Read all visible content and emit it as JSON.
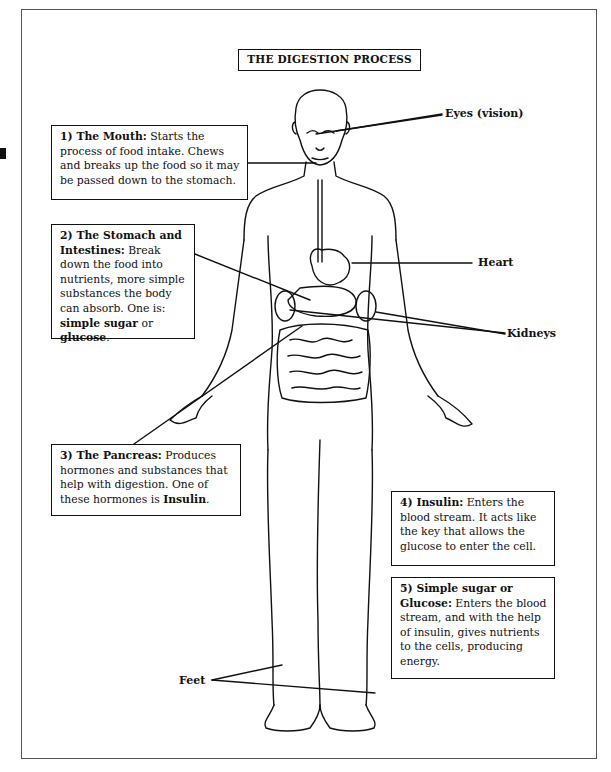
{
  "title": "THE DIGESTION PROCESS",
  "boxes": [
    {
      "id": "mouth",
      "heading": "1) The Mouth:",
      "text": " Starts the process of food intake. Chews and breaks up the food so it may be passed down to the stomach."
    },
    {
      "id": "stomach",
      "heading": "2) The Stomach and Intestines:",
      "text": " Break down the food into nutrients, more simple substances the body can absorb. One is: ",
      "bold_tail": "simple sugar",
      "mid": " or ",
      "bold_end": "glucose",
      "end": "."
    },
    {
      "id": "pancreas",
      "heading": "3) The Pancreas:",
      "text": " Produces hormones and substances that help with digestion. One of these hormones is ",
      "bold_tail": "Insulin",
      "end": "."
    },
    {
      "id": "insulin",
      "heading": "4) Insulin:",
      "text": " Enters the blood stream. It acts like the key that allows the glucose to enter the cell."
    },
    {
      "id": "glucose",
      "heading": "5) Simple sugar or Glucose:",
      "text": " Enters the blood stream, and with the help of insulin, gives nutrients to the cells, producing energy."
    }
  ],
  "labels": {
    "eyes": "Eyes (vision)",
    "heart": "Heart",
    "kidneys": "Kidneys",
    "feet": "Feet"
  }
}
